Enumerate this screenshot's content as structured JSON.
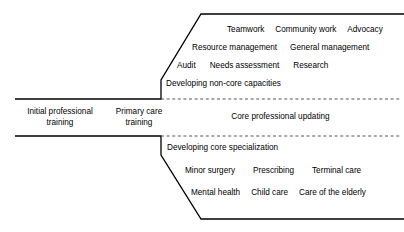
{
  "diagram": {
    "stages": [
      {
        "id": "initial",
        "line1": "Initial professional",
        "line2": "training"
      },
      {
        "id": "primary",
        "line1": "Primary care",
        "line2": "training"
      }
    ],
    "middle_branch": {
      "label": "Core professional updating"
    },
    "upper_branch": {
      "heading": "Developing non-core capacities",
      "rows": [
        [
          "Audit",
          "Needs assessment",
          "Research"
        ],
        [
          "Resource management",
          "General management"
        ],
        [
          "Teamwork",
          "Community work",
          "Advocacy"
        ]
      ]
    },
    "lower_branch": {
      "heading": "Developing core specialization",
      "rows": [
        [
          "Minor surgery",
          "Prescribing",
          "Terminal care"
        ],
        [
          "Mental health",
          "Child care",
          "Care of the elderly"
        ]
      ]
    },
    "colors": {
      "stroke": "#000000",
      "dashed": "#808080",
      "background": "#ffffff",
      "text": "#000000"
    }
  }
}
